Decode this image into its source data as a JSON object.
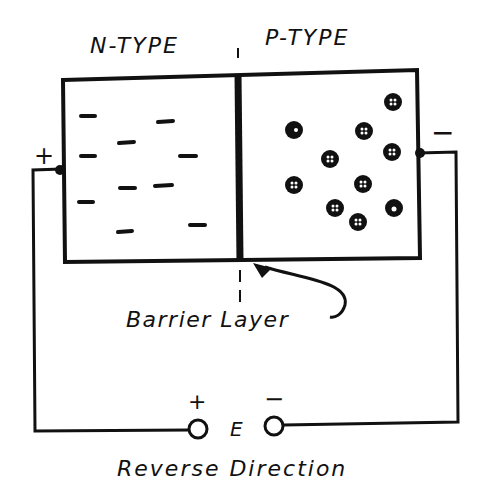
{
  "diagram": {
    "n_region": {
      "label": "N-TYPE",
      "carrier_symbol": "−",
      "carrier_count": 10
    },
    "p_region": {
      "label": "P-TYPE",
      "carrier_symbol": "⊕",
      "carrier_count": 11
    },
    "junction_label": "Barrier Layer",
    "left_terminal_sign": "+",
    "right_terminal_sign": "−",
    "source": {
      "label": "E",
      "positive_sign": "+",
      "negative_sign": "−"
    },
    "caption": "Reverse Direction",
    "colors": {
      "ink": "#111111",
      "background": "#ffffff"
    }
  }
}
